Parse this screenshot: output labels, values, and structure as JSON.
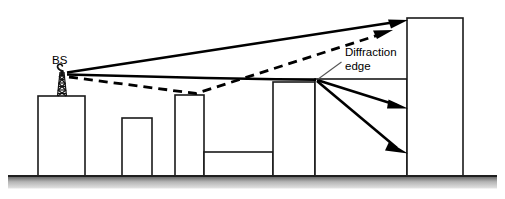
{
  "figure": {
    "domain": "Diagram",
    "canvas": {
      "width": 505,
      "height": 199,
      "background": "#ffffff"
    },
    "colors": {
      "ink": "#000000",
      "building_stroke": "#1a1a1a",
      "building_fill": "#ffffff",
      "ground_dark": "#3a3a3a",
      "ground_light": "#d8d8d8",
      "leader_line": "#555555"
    }
  },
  "labels": {
    "base_station": "BS",
    "diffraction_edge_line1": "Diffraction",
    "diffraction_edge_line2": "edge"
  },
  "annotations": [
    {
      "name": "bs-label",
      "text": "BS",
      "x": 52,
      "y": 63,
      "describes": "base-station antenna mounted on the leftmost building rooftop"
    },
    {
      "name": "diffraction-edge-label",
      "text": "Diffraction edge",
      "x": 345,
      "y": 58,
      "describes": "rooftop corner acting as the knife edge that diffracts the signal downward"
    }
  ],
  "ground": {
    "name": "ground-strip",
    "top_y": 175,
    "height": 13,
    "x_start": 8,
    "x_end": 497
  },
  "buildings": [
    {
      "name": "building-1-bs-host",
      "x": 38,
      "y": 96,
      "width": 47,
      "height": 79
    },
    {
      "name": "building-2-short",
      "x": 122,
      "y": 118,
      "width": 30,
      "height": 57
    },
    {
      "name": "building-3-mid",
      "x": 175,
      "y": 95,
      "width": 29,
      "height": 80
    },
    {
      "name": "building-4-low-wide",
      "x": 204,
      "y": 152,
      "width": 69,
      "height": 23
    },
    {
      "name": "building-5-tall-edge",
      "x": 273,
      "y": 82,
      "width": 42,
      "height": 93
    },
    {
      "name": "building-6-diffractor",
      "x": 315,
      "y": 79,
      "width": 92,
      "height": 96
    },
    {
      "name": "building-7-receiver-tower",
      "x": 407,
      "y": 18,
      "width": 56,
      "height": 157
    }
  ],
  "antenna": {
    "name": "bs-antenna-tower",
    "base_x": 62,
    "base_y": 96,
    "top_y": 70,
    "mast_half_width_bottom": 5,
    "mast_half_width_top": 2.5,
    "lattice_rungs": 5
  },
  "rays": {
    "direct_los": {
      "name": "ray-direct-line-of-sight",
      "style": "solid",
      "from": {
        "x": 66,
        "y": 72
      },
      "to": {
        "x": 407,
        "y": 21
      },
      "arrow": true,
      "description": "Direct unobstructed path from base station to the top of the far tall building"
    },
    "rooftop_grazing": {
      "name": "ray-rooftop-grazing-to-diffraction-edge",
      "style": "solid",
      "points": [
        {
          "x": 66,
          "y": 74
        },
        {
          "x": 315,
          "y": 79
        }
      ],
      "arrow": false,
      "description": "Grazing path along the rooftops arriving at the diffraction edge"
    },
    "reflected_dashed": {
      "name": "ray-reflected-dashed",
      "style": "dashed",
      "points": [
        {
          "x": 66,
          "y": 76
        },
        {
          "x": 196,
          "y": 93
        },
        {
          "x": 391,
          "y": 32
        }
      ],
      "arrow": true,
      "description": "Multipath component reflected off an intermediate rooftop then up to the receiver building"
    },
    "diffracted_upper": {
      "name": "ray-diffracted-upper",
      "style": "solid",
      "from": {
        "x": 317,
        "y": 80
      },
      "to": {
        "x": 407,
        "y": 108
      },
      "arrow": true,
      "description": "First diffracted ray bending down behind the edge onto the receiver wall"
    },
    "diffracted_lower": {
      "name": "ray-diffracted-lower",
      "style": "solid",
      "from": {
        "x": 317,
        "y": 81
      },
      "to": {
        "x": 407,
        "y": 152
      },
      "arrow": true,
      "description": "Second, more steeply diffracted ray reaching lower on the receiver wall"
    }
  },
  "leader": {
    "name": "diffraction-edge-leader-line",
    "from": {
      "x": 341,
      "y": 62
    },
    "to": {
      "x": 317,
      "y": 80
    }
  }
}
